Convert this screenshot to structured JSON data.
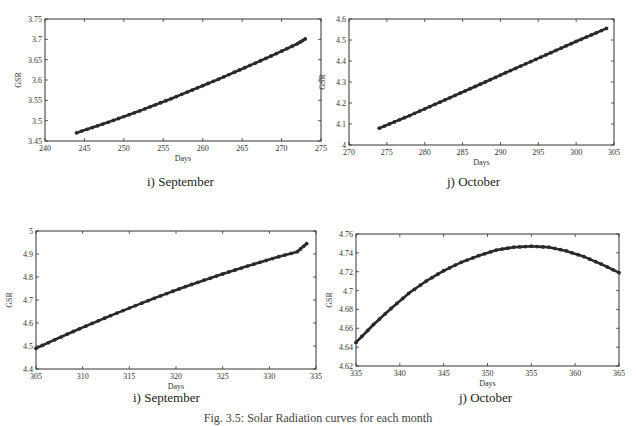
{
  "chart_data": [
    {
      "type": "line",
      "id": "top-left",
      "caption": "i) September",
      "xlabel": "Days",
      "ylabel": "GSR",
      "xlim": [
        240,
        275
      ],
      "ylim": [
        3.45,
        3.75
      ],
      "xticks": [
        240,
        245,
        250,
        255,
        260,
        265,
        270,
        275
      ],
      "yticks": [
        3.45,
        3.5,
        3.55,
        3.6,
        3.65,
        3.7,
        3.75
      ],
      "ytick_labels": [
        "3.45",
        "3.5",
        "3.55",
        "3.6",
        "3.65",
        "3.7",
        "3.75"
      ],
      "grid": false,
      "series": [
        {
          "name": "GSR",
          "x": [
            244,
            246,
            248,
            250,
            252,
            254,
            256,
            258,
            260,
            262,
            264,
            266,
            268,
            270,
            272,
            273
          ],
          "y": [
            3.47,
            3.483,
            3.496,
            3.51,
            3.524,
            3.539,
            3.554,
            3.57,
            3.586,
            3.602,
            3.619,
            3.636,
            3.653,
            3.671,
            3.689,
            3.701
          ]
        }
      ]
    },
    {
      "type": "line",
      "id": "top-right",
      "caption": "j) October",
      "xlabel": "Days",
      "ylabel": "GSR",
      "xlim": [
        270,
        305
      ],
      "ylim": [
        4.0,
        4.6
      ],
      "xticks": [
        270,
        275,
        280,
        285,
        290,
        295,
        300,
        305
      ],
      "yticks": [
        4.0,
        4.1,
        4.2,
        4.3,
        4.4,
        4.5,
        4.6
      ],
      "ytick_labels": [
        "4",
        "4.1",
        "4.2",
        "4.3",
        "4.4",
        "4.5",
        "4.6"
      ],
      "grid": false,
      "series": [
        {
          "name": "GSR",
          "x": [
            274,
            276,
            278,
            280,
            282,
            284,
            286,
            288,
            290,
            292,
            294,
            296,
            298,
            300,
            302,
            304
          ],
          "y": [
            4.08,
            4.11,
            4.14,
            4.172,
            4.204,
            4.236,
            4.268,
            4.3,
            4.333,
            4.365,
            4.397,
            4.429,
            4.461,
            4.493,
            4.524,
            4.555
          ]
        }
      ]
    },
    {
      "type": "line",
      "id": "bottom-left",
      "caption": "i) September",
      "xlabel": "Days",
      "ylabel": "GSR",
      "xlim": [
        305,
        335
      ],
      "ylim": [
        4.4,
        5.0
      ],
      "xticks": [
        305,
        310,
        315,
        320,
        325,
        330,
        335
      ],
      "yticks": [
        4.4,
        4.5,
        4.6,
        4.7,
        4.8,
        4.9,
        5.0
      ],
      "ytick_labels": [
        "4.4",
        "4.5",
        "4.6",
        "4.7",
        "4.8",
        "4.9",
        "5"
      ],
      "grid": false,
      "series": [
        {
          "name": "GSR",
          "x": [
            305,
            307,
            309,
            311,
            313,
            315,
            317,
            319,
            321,
            323,
            325,
            327,
            329,
            331,
            333,
            334
          ],
          "y": [
            4.49,
            4.527,
            4.563,
            4.598,
            4.632,
            4.665,
            4.697,
            4.728,
            4.758,
            4.786,
            4.813,
            4.839,
            4.864,
            4.888,
            4.91,
            4.945
          ]
        }
      ]
    },
    {
      "type": "line",
      "id": "bottom-right",
      "caption": "j) October",
      "xlabel": "Days",
      "ylabel": "GSR",
      "xlim": [
        335,
        365
      ],
      "ylim": [
        4.62,
        4.76
      ],
      "xticks": [
        335,
        340,
        345,
        350,
        355,
        360,
        365
      ],
      "yticks": [
        4.62,
        4.64,
        4.66,
        4.68,
        4.7,
        4.72,
        4.74,
        4.76
      ],
      "ytick_labels": [
        "4.62",
        "4.64",
        "4.66",
        "4.68",
        "4.7",
        "4.72",
        "4.74",
        "4.76"
      ],
      "grid": false,
      "series": [
        {
          "name": "GSR",
          "x": [
            335,
            337,
            339,
            341,
            343,
            345,
            347,
            349,
            351,
            353,
            355,
            357,
            359,
            361,
            363,
            365
          ],
          "y": [
            4.645,
            4.664,
            4.681,
            4.697,
            4.71,
            4.721,
            4.73,
            4.737,
            4.743,
            4.746,
            4.747,
            4.746,
            4.742,
            4.736,
            4.728,
            4.719
          ]
        }
      ]
    }
  ],
  "figure": {
    "caption": "Fig. 3.5: Solar Radiation curves for each month"
  },
  "style": {
    "line_color": "#2a2a2a",
    "axis_color": "#333333"
  }
}
